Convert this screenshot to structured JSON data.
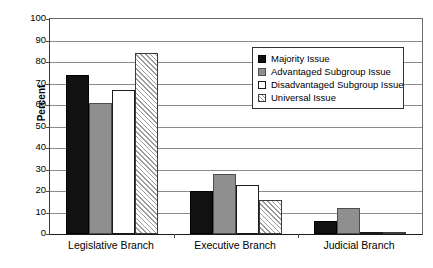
{
  "chart_data": {
    "type": "bar",
    "title": "",
    "xlabel": "",
    "ylabel": "Percent",
    "ylim": [
      0,
      100
    ],
    "ytick_step": 10,
    "yticks": [
      100,
      90,
      80,
      70,
      60,
      50,
      40,
      30,
      20,
      10,
      0
    ],
    "ytick_labels": [
      "100",
      "90",
      "80",
      "70",
      "60",
      "50",
      "40",
      "30",
      "20",
      "10",
      "0"
    ],
    "grid": true,
    "legend_position": "upper-right",
    "categories": [
      "Legislative Branch",
      "Executive Branch",
      "Judicial Branch"
    ],
    "series": [
      {
        "name": "Majority Issue",
        "swatch": "solid-black",
        "color": "#111111",
        "values": [
          74,
          20,
          6
        ]
      },
      {
        "name": "Advantaged Subgroup Issue",
        "swatch": "solid-gray",
        "color": "#8f8f8f",
        "values": [
          61,
          28,
          12
        ]
      },
      {
        "name": "Disadvantaged Subgroup Issue",
        "swatch": "white-outline",
        "color": "#ffffff",
        "values": [
          67,
          23,
          0
        ]
      },
      {
        "name": "Universal Issue",
        "swatch": "diagonal-hatch",
        "color": "#9a9a9a",
        "values": [
          84,
          16,
          1
        ]
      }
    ]
  }
}
